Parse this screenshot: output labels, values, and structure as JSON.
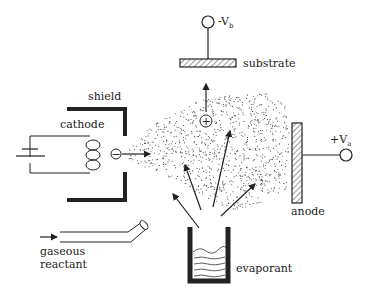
{
  "diagram": {
    "labels": {
      "shield": "shield",
      "cathode": "cathode",
      "substrate": "substrate",
      "anode": "anode",
      "evaporant": "evaporant",
      "gaseous_line1": "gaseous",
      "gaseous_line2": "reactant",
      "vb_prefix": "-V",
      "vb_sub": "b",
      "va_prefix": "+V",
      "va_sub": "a",
      "electron_symbol": "−",
      "ion_symbol": "+"
    },
    "colors": {
      "ink": "#222222",
      "background": "#ffffff",
      "dots": "#444444"
    }
  }
}
